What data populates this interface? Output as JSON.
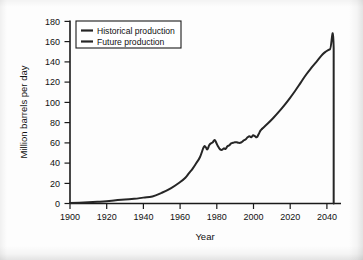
{
  "chart_data": {
    "type": "line",
    "title": "",
    "xlabel": "Year",
    "ylabel": "Million barrels per day",
    "xlim": [
      1900,
      2048
    ],
    "ylim": [
      0,
      180
    ],
    "grid": false,
    "legend_position": "top-left",
    "xticks": [
      1900,
      1920,
      1940,
      1960,
      1980,
      2000,
      2020,
      2040
    ],
    "xtick_labels": [
      "1900",
      "1920",
      "1940",
      "1960",
      "1980",
      "2000",
      "2020",
      "2040"
    ],
    "yticks": [
      0,
      20,
      40,
      60,
      80,
      100,
      120,
      140,
      160,
      180
    ],
    "ytick_labels": [
      "0",
      "20",
      "40",
      "60",
      "80",
      "100",
      "120",
      "140",
      "160",
      "180"
    ],
    "legend": [
      {
        "name": "Historical production",
        "color": "#262626"
      },
      {
        "name": "Future production",
        "color": "#262626"
      }
    ],
    "series": [
      {
        "name": "Historical production",
        "color": "#262626",
        "x": [
          1900,
          1905,
          1910,
          1915,
          1920,
          1925,
          1930,
          1935,
          1940,
          1945,
          1950,
          1955,
          1960,
          1963,
          1965,
          1967,
          1969,
          1971,
          1973,
          1974,
          1975,
          1976,
          1977,
          1978,
          1979,
          1980,
          1981,
          1982,
          1983,
          1984,
          1985,
          1986,
          1987,
          1988,
          1989,
          1990,
          1991,
          1992,
          1993,
          1994,
          1995,
          1996,
          1997,
          1998,
          1999,
          2000,
          2001,
          2002,
          2003,
          2004,
          2005
        ],
        "y": [
          0.5,
          0.8,
          1.2,
          1.7,
          2.3,
          3.2,
          4.0,
          4.6,
          5.8,
          7.0,
          10.5,
          15.0,
          21.0,
          25.5,
          30.0,
          34.5,
          40.0,
          46.0,
          55.5,
          56.0,
          53.5,
          57.5,
          59.5,
          60.5,
          62.8,
          59.5,
          56.0,
          53.5,
          53.0,
          54.5,
          54.0,
          56.5,
          57.5,
          59.5,
          60.0,
          60.5,
          60.5,
          60.0,
          60.0,
          61.0,
          62.5,
          63.5,
          65.5,
          66.5,
          65.5,
          67.5,
          66.5,
          65.5,
          68.5,
          72.0,
          74.0
        ]
      },
      {
        "name": "Future production",
        "color": "#262626",
        "x": [
          2005,
          2008,
          2011,
          2014,
          2017,
          2020,
          2023,
          2026,
          2029,
          2032,
          2035,
          2038,
          2040,
          2042,
          2044,
          2044
        ],
        "y": [
          74.0,
          79.0,
          84.5,
          90.5,
          97.0,
          104.0,
          111.5,
          119.5,
          127.5,
          134.5,
          141.0,
          147.5,
          150.5,
          152.5,
          153.5,
          0.0
        ]
      }
    ]
  }
}
